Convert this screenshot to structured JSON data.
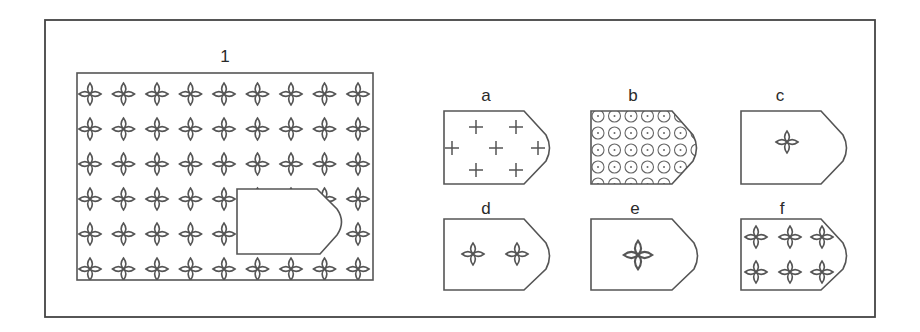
{
  "puzzle": {
    "main_label": "1",
    "options": [
      {
        "id": "a",
        "label": "a",
        "pattern": "plus-signs"
      },
      {
        "id": "b",
        "label": "b",
        "pattern": "dense-small-stars"
      },
      {
        "id": "c",
        "label": "c",
        "pattern": "single-star"
      },
      {
        "id": "d",
        "label": "d",
        "pattern": "two-stars"
      },
      {
        "id": "e",
        "label": "e",
        "pattern": "single-large-star"
      },
      {
        "id": "f",
        "label": "f",
        "pattern": "six-stars"
      }
    ]
  },
  "colors": {
    "stroke": "#555555",
    "background": "#ffffff",
    "text": "#2a2a2a"
  }
}
